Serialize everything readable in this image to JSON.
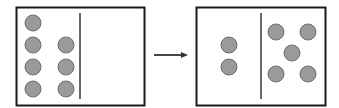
{
  "diagram": {
    "colors": {
      "border": "#1a1a1a",
      "circle_fill": "#9a9a9a",
      "circle_stroke": "#6e6e6e",
      "arrow": "#333333",
      "background": "#ffffff"
    },
    "before": {
      "box": {
        "x": 16,
        "y": 7,
        "w": 128,
        "h": 98
      },
      "divider_x": 80,
      "divider_y1": 13,
      "divider_y2": 99,
      "left_count": 7,
      "right_count": 0,
      "circles": [
        {
          "cx": 33,
          "cy": 23
        },
        {
          "cx": 33,
          "cy": 45
        },
        {
          "cx": 33,
          "cy": 67
        },
        {
          "cx": 33,
          "cy": 89
        },
        {
          "cx": 66,
          "cy": 45
        },
        {
          "cx": 66,
          "cy": 67
        },
        {
          "cx": 66,
          "cy": 89
        }
      ]
    },
    "arrow": {
      "x1": 154,
      "y1": 55,
      "x2": 188,
      "y2": 55
    },
    "after": {
      "box": {
        "x": 196,
        "y": 7,
        "w": 129,
        "h": 98
      },
      "divider_x": 261,
      "divider_y1": 13,
      "divider_y2": 99,
      "left_count": 2,
      "right_count": 5,
      "circles": [
        {
          "cx": 229,
          "cy": 45
        },
        {
          "cx": 229,
          "cy": 67
        },
        {
          "cx": 276,
          "cy": 32
        },
        {
          "cx": 308,
          "cy": 32
        },
        {
          "cx": 292,
          "cy": 53
        },
        {
          "cx": 276,
          "cy": 74
        },
        {
          "cx": 308,
          "cy": 74
        }
      ]
    },
    "circle_radius": 8
  }
}
